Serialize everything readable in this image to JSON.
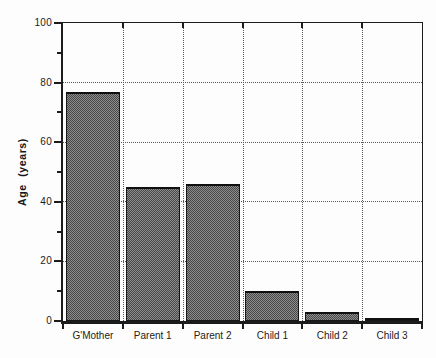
{
  "figure": {
    "background": "#fdfdfd",
    "axis_color": "#1c1c1c",
    "grid_color": "#5a5a5a",
    "bar_fill_dark": "#474747",
    "bar_fill_light": "#8d8d8d",
    "bar_border": "#161616"
  },
  "chart_data": {
    "type": "bar",
    "title": "",
    "xlabel": "",
    "ylabel": "Age (years)",
    "categories": [
      "G'Mother",
      "Parent 1",
      "Parent 2",
      "Child 1",
      "Child 2",
      "Child 3"
    ],
    "values": [
      77,
      45,
      46,
      10,
      3,
      1
    ],
    "ylim": [
      0,
      100
    ],
    "ytick_labels": [
      "0",
      "20",
      "40",
      "60",
      "80",
      "100"
    ],
    "ytick_values": [
      0,
      20,
      40,
      60,
      80,
      100
    ],
    "minor_tick_values": [
      10,
      30,
      50,
      70,
      90
    ],
    "grid": "dotted horizontal lines at major y ticks; dotted vertical separators at category boundaries",
    "legend": "none",
    "bar_texture": "gray halftone checker with black outline"
  }
}
